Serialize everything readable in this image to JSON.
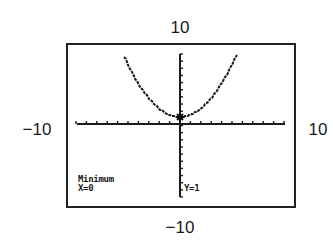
{
  "window_labels": {
    "ymax": "10",
    "xmin": "−10",
    "xmax": "10",
    "ymin": "−10"
  },
  "screen": {
    "result_label": "Minimum",
    "x_readout": "X=0",
    "y_readout": "Y=1"
  },
  "chart_data": {
    "type": "line",
    "title": "",
    "xlabel": "",
    "ylabel": "",
    "xlim": [
      -10,
      10
    ],
    "ylim": [
      -10,
      10
    ],
    "xscl": 1,
    "yscl": 1,
    "grid": false,
    "series": [
      {
        "name": "y = x^2 + 1 (approx. graphed curve)",
        "x": [
          -5.5,
          -5,
          -4,
          -3,
          -2,
          -1,
          0,
          1,
          2,
          3,
          4,
          5,
          5.5
        ],
        "y": [
          10,
          8.5,
          5.8,
          3.8,
          2.3,
          1.3,
          1,
          1.3,
          2.3,
          3.8,
          5.8,
          8.5,
          10
        ]
      }
    ],
    "annotations": [
      {
        "text": "Minimum",
        "x": 0,
        "y": 1
      },
      {
        "text": "X=0"
      },
      {
        "text": "Y=1"
      }
    ],
    "legend": null
  }
}
